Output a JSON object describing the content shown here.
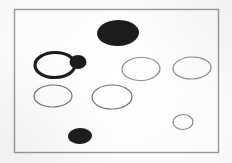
{
  "figure": {
    "canvas": {
      "width": 232,
      "height": 163,
      "background": "#fdfdfd"
    },
    "frame": {
      "name": "outer-frame",
      "x": 14.5,
      "y": 9.5,
      "width": 204,
      "height": 143,
      "stroke": "#9a9a9a",
      "stroke_width": 1.4,
      "fill": "#ffffff"
    },
    "palette": {
      "fill_black": "#1c1c1c",
      "outline_dark": "#2b2b2b",
      "outline_light": "#8d8d8d",
      "frame": "#9a9a9a",
      "page": "#fdfdfd"
    },
    "shapes": [
      {
        "id": "ellipse-large-filled-top",
        "label": "Large filled ellipse (top center)",
        "style": "filled",
        "cx": 118,
        "cy": 33,
        "rx": 21,
        "ry": 13,
        "rotation": -2,
        "fill": "#1c1c1c",
        "stroke": "#1c1c1c",
        "stroke_width": 0
      },
      {
        "id": "ellipse-bold-outline-left",
        "label": "Bold outlined ellipse (left middle)",
        "style": "bold-outline",
        "cx": 55,
        "cy": 65,
        "rx": 20,
        "ry": 12.5,
        "rotation": -1,
        "fill": "#ffffff",
        "stroke": "#1c1c1c",
        "stroke_width": 3.2
      },
      {
        "id": "ellipse-small-filled-attached",
        "label": "Small filled ellipse attached right of bold ellipse",
        "style": "filled",
        "cx": 78,
        "cy": 62,
        "rx": 8.5,
        "ry": 7,
        "rotation": 0,
        "fill": "#1c1c1c",
        "stroke": "#1c1c1c",
        "stroke_width": 0
      },
      {
        "id": "ellipse-thin-center-right-1",
        "label": "Thin outlined ellipse (center right, upper row)",
        "style": "thin-outline",
        "cx": 141,
        "cy": 69,
        "rx": 19,
        "ry": 11.5,
        "rotation": -2,
        "fill": "#ffffff",
        "stroke": "#8d8d8d",
        "stroke_width": 1.2
      },
      {
        "id": "ellipse-thin-far-right",
        "label": "Thin outlined ellipse (far right, upper row)",
        "style": "thin-outline",
        "cx": 192,
        "cy": 68,
        "rx": 19,
        "ry": 11,
        "rotation": -2,
        "fill": "#ffffff",
        "stroke": "#8d8d8d",
        "stroke_width": 1.2
      },
      {
        "id": "ellipse-thin-left-lower",
        "label": "Thin outlined ellipse (left, lower row)",
        "style": "thin-outline",
        "cx": 53,
        "cy": 96,
        "rx": 19,
        "ry": 11,
        "rotation": -1,
        "fill": "#ffffff",
        "stroke": "#6f6f6f",
        "stroke_width": 1.2
      },
      {
        "id": "ellipse-thin-center-lower",
        "label": "Thin outlined ellipse (center, lower row)",
        "style": "thin-outline",
        "cx": 112,
        "cy": 97,
        "rx": 20,
        "ry": 12,
        "rotation": -1,
        "fill": "#ffffff",
        "stroke": "#6f6f6f",
        "stroke_width": 1.2
      },
      {
        "id": "ellipse-thin-small-bottom-right",
        "label": "Small thin outlined ellipse (bottom right)",
        "style": "thin-outline",
        "cx": 183,
        "cy": 122,
        "rx": 10,
        "ry": 7.5,
        "rotation": -2,
        "fill": "#ffffff",
        "stroke": "#8d8d8d",
        "stroke_width": 1.2
      },
      {
        "id": "ellipse-filled-bottom-left",
        "label": "Filled ellipse (bottom, left of center)",
        "style": "filled",
        "cx": 80,
        "cy": 136,
        "rx": 12,
        "ry": 8,
        "rotation": -3,
        "fill": "#1c1c1c",
        "stroke": "#1c1c1c",
        "stroke_width": 0
      }
    ],
    "counts": {
      "total_shapes": 9,
      "filled": 3,
      "bold_outline": 1,
      "thin_outline": 5
    }
  }
}
